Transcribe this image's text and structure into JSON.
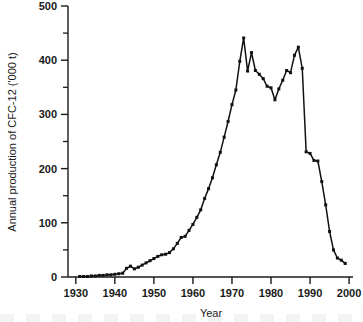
{
  "figure": {
    "background_color": "#ffffff",
    "line_color": "#111111"
  },
  "chart_data": {
    "type": "line",
    "title": "",
    "subtitle": "",
    "xlabel": "Year",
    "ylabel": "Annual production of CFC-12 ('000 t)",
    "xlim": [
      1928,
      2001
    ],
    "ylim": [
      0,
      500
    ],
    "grid": false,
    "legend": null,
    "legend_position": "none",
    "x_ticks_major": [
      1930,
      1940,
      1950,
      1960,
      1970,
      1980,
      1990,
      2000
    ],
    "x_tick_labels": [
      "1930",
      "1940",
      "1950",
      "1960",
      "1970",
      "1980",
      "1990",
      "2000"
    ],
    "x_ticks_minor": [
      1935,
      1945,
      1955,
      1965,
      1975,
      1985,
      1995
    ],
    "y_ticks_major": [
      0,
      100,
      200,
      300,
      400,
      500
    ],
    "y_tick_labels": [
      "0",
      "100",
      "200",
      "300",
      "400",
      "500"
    ],
    "y_ticks_minor": [
      50,
      150,
      250,
      350,
      450
    ],
    "series": [
      {
        "name": "Annual production of CFC-12",
        "marker": "filled-square",
        "x": [
          1931,
          1932,
          1933,
          1934,
          1935,
          1936,
          1937,
          1938,
          1939,
          1940,
          1941,
          1942,
          1943,
          1944,
          1945,
          1946,
          1947,
          1948,
          1949,
          1950,
          1951,
          1952,
          1953,
          1954,
          1955,
          1956,
          1957,
          1958,
          1959,
          1960,
          1961,
          1962,
          1963,
          1964,
          1965,
          1966,
          1967,
          1968,
          1969,
          1970,
          1971,
          1972,
          1973,
          1974,
          1975,
          1976,
          1977,
          1978,
          1979,
          1980,
          1981,
          1982,
          1983,
          1984,
          1985,
          1986,
          1987,
          1988,
          1989,
          1990,
          1991,
          1992,
          1993,
          1994,
          1995,
          1996,
          1997,
          1998,
          1999
        ],
        "values": [
          1,
          1,
          1,
          2,
          2,
          3,
          3,
          4,
          4,
          5,
          6,
          7,
          16,
          20,
          15,
          18,
          22,
          26,
          30,
          34,
          38,
          41,
          42,
          45,
          52,
          62,
          73,
          75,
          86,
          97,
          110,
          124,
          145,
          163,
          183,
          207,
          230,
          258,
          287,
          318,
          345,
          398,
          441,
          380,
          414,
          381,
          374,
          366,
          352,
          349,
          327,
          347,
          363,
          381,
          377,
          409,
          424,
          385,
          231,
          228,
          215,
          214,
          176,
          133,
          84,
          50,
          35,
          31,
          25
        ]
      }
    ]
  },
  "footer": {
    "clipped_caption": ""
  }
}
